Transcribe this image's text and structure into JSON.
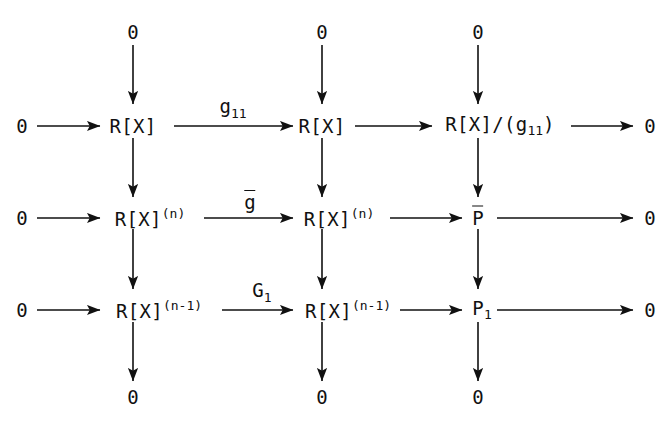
{
  "diagram": {
    "stroke_color": "#111111",
    "background_color": "#ffffff",
    "top_zeros": [
      "0",
      "0",
      "0"
    ],
    "bottom_zeros": [
      "0",
      "0",
      "0"
    ],
    "row_left_zeros": [
      "0",
      "0",
      "0"
    ],
    "row_right_zeros": [
      "0",
      "0",
      "0"
    ],
    "rows": [
      {
        "id": "row-1",
        "left_zero": "0",
        "col1": {
          "base": "R[X]",
          "sup": "",
          "sub": ""
        },
        "label": {
          "base": "g",
          "sub": "11",
          "overbar": false
        },
        "col2": {
          "base": "R[X]",
          "sup": "",
          "sub": ""
        },
        "col3": {
          "base": "R[X]/(g",
          "sub": "11",
          "tail": ")",
          "overbar": false
        },
        "right_zero": "0"
      },
      {
        "id": "row-2",
        "left_zero": "0",
        "col1": {
          "base": "R[X]",
          "sup": "(n)",
          "sub": ""
        },
        "label": {
          "base": "g",
          "sub": "",
          "overbar": true
        },
        "col2": {
          "base": "R[X]",
          "sup": "(n)",
          "sub": ""
        },
        "col3": {
          "base": "P",
          "sub": "",
          "tail": "",
          "overbar": true
        },
        "right_zero": "0"
      },
      {
        "id": "row-3",
        "left_zero": "0",
        "col1": {
          "base": "R[X]",
          "sup": "(n-1)",
          "sub": ""
        },
        "label": {
          "base": "G",
          "sub": "1",
          "overbar": false
        },
        "col2": {
          "base": "R[X]",
          "sup": "(n-1)",
          "sub": ""
        },
        "col3": {
          "base": "P",
          "sub": "1",
          "tail": "",
          "overbar": false
        },
        "right_zero": "0"
      }
    ]
  }
}
